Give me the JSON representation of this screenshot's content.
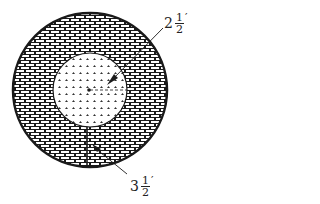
{
  "diagram": {
    "type": "concentric-circles",
    "outer_circle": {
      "fill_pattern": "brick",
      "cx": 90,
      "cy": 90,
      "r": 77
    },
    "inner_circle": {
      "fill_pattern": "stipple",
      "cx": 90,
      "cy": 90,
      "r": 37
    },
    "labels": {
      "inner_radius": {
        "whole": "2",
        "numerator": "1",
        "denominator": "2",
        "unit": "′"
      },
      "ring_width": {
        "whole": "3",
        "numerator": "1",
        "denominator": "2",
        "unit": "′"
      }
    },
    "colors": {
      "line": "#1a1a1a",
      "background": "#ffffff"
    }
  }
}
